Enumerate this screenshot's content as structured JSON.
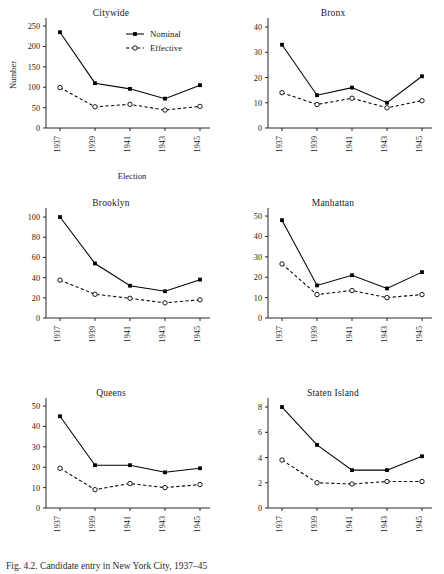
{
  "figure": {
    "caption": "Fig. 4.2. Candidate entry in New York City, 1937–45",
    "y_axis_label": "Number",
    "x_axis_label": "Election"
  },
  "legend": {
    "position": "top-right-of-first-panel",
    "entries": [
      {
        "label": "Nominal",
        "style": "solid",
        "marker": "filled-square",
        "color": "#000000"
      },
      {
        "label": "Effective",
        "style": "dashed",
        "marker": "open-circle",
        "color": "#000000"
      }
    ]
  },
  "chart_data": [
    {
      "type": "line",
      "title": "Citywide",
      "xlabel": "Election",
      "ylabel": "Number",
      "categories": [
        "1937",
        "1939",
        "1941",
        "1943",
        "1945"
      ],
      "ylim": [
        0,
        260
      ],
      "yticks": [
        0,
        50,
        100,
        150,
        200,
        250
      ],
      "grid": false,
      "series": [
        {
          "name": "Nominal",
          "values": [
            235,
            110,
            96,
            72,
            105
          ]
        },
        {
          "name": "Effective",
          "values": [
            99,
            52,
            58,
            44,
            53
          ]
        }
      ]
    },
    {
      "type": "line",
      "title": "Bronx",
      "xlabel": "Election",
      "ylabel": "Number",
      "categories": [
        "1937",
        "1939",
        "1941",
        "1943",
        "1945"
      ],
      "ylim": [
        0,
        42
      ],
      "yticks": [
        0,
        10,
        20,
        30,
        40
      ],
      "grid": false,
      "series": [
        {
          "name": "Nominal",
          "values": [
            33,
            13,
            16,
            10,
            20.5
          ]
        },
        {
          "name": "Effective",
          "values": [
            14,
            9.3,
            11.8,
            8,
            10.8
          ]
        }
      ]
    },
    {
      "type": "line",
      "title": "Brooklyn",
      "xlabel": "Election",
      "ylabel": "Number",
      "categories": [
        "1937",
        "1939",
        "1941",
        "1943",
        "1945"
      ],
      "ylim": [
        0,
        105
      ],
      "yticks": [
        0,
        20,
        40,
        60,
        80,
        100
      ],
      "grid": false,
      "series": [
        {
          "name": "Nominal",
          "values": [
            100,
            54,
            32,
            26.5,
            38
          ]
        },
        {
          "name": "Effective",
          "values": [
            37.5,
            23.5,
            19.5,
            15,
            18
          ]
        }
      ]
    },
    {
      "type": "line",
      "title": "Manhattan",
      "xlabel": "Election",
      "ylabel": "Number",
      "categories": [
        "1937",
        "1939",
        "1941",
        "1943",
        "1945"
      ],
      "ylim": [
        0,
        52
      ],
      "yticks": [
        0,
        10,
        20,
        30,
        40,
        50
      ],
      "grid": false,
      "series": [
        {
          "name": "Nominal",
          "values": [
            48,
            16,
            21,
            14.5,
            22.5
          ]
        },
        {
          "name": "Effective",
          "values": [
            26.5,
            11.5,
            13.5,
            10,
            11.5
          ]
        }
      ]
    },
    {
      "type": "line",
      "title": "Queens",
      "xlabel": "Election",
      "ylabel": "Number",
      "categories": [
        "1937",
        "1939",
        "1941",
        "1943",
        "1945"
      ],
      "ylim": [
        0,
        52
      ],
      "yticks": [
        0,
        10,
        20,
        30,
        40,
        50
      ],
      "grid": false,
      "series": [
        {
          "name": "Nominal",
          "values": [
            45,
            21,
            21,
            17.5,
            19.5
          ]
        },
        {
          "name": "Effective",
          "values": [
            19.5,
            9,
            12,
            10,
            11.5
          ]
        }
      ]
    },
    {
      "type": "line",
      "title": "Staten Island",
      "xlabel": "Election",
      "ylabel": "Number",
      "categories": [
        "1937",
        "1939",
        "1941",
        "1943",
        "1945"
      ],
      "ylim": [
        0,
        8.4
      ],
      "yticks": [
        0,
        2,
        4,
        6,
        8
      ],
      "grid": false,
      "series": [
        {
          "name": "Nominal",
          "values": [
            8,
            5,
            3,
            3,
            4.1
          ]
        },
        {
          "name": "Effective",
          "values": [
            3.8,
            2,
            1.9,
            2.1,
            2.1
          ]
        }
      ]
    }
  ]
}
